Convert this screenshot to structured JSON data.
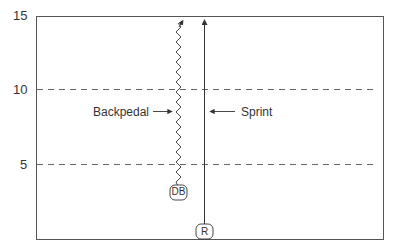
{
  "diagram": {
    "y_axis": {
      "ticks": [
        "15",
        "10",
        "5"
      ]
    },
    "labels": {
      "backpedal": "Backpedal",
      "sprint": "Sprint"
    },
    "players": {
      "defender": "DB",
      "receiver": "R"
    },
    "colors": {
      "line": "#333333",
      "frame": "#555555",
      "dash": "#666666"
    }
  }
}
